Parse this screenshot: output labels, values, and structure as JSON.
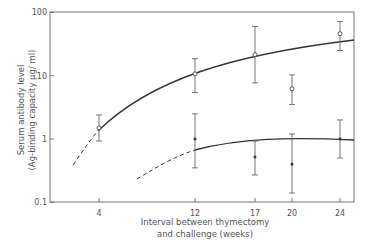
{
  "chart_data": {
    "type": "scatter",
    "title": "",
    "xlabel": "Interval between thymectomy and challenge (weeks)",
    "xlabel_lines": [
      "Interval between thymectomy",
      "and challenge (weeks)"
    ],
    "ylabel": "Serum antibody level (Ag-binding capacity µg/ml)",
    "ylabel_lines": [
      "Serum antibody level",
      "(Ag-binding capacity μg/ ml)"
    ],
    "yscale": "log",
    "ylim": [
      0.1,
      100
    ],
    "x_ticks": [
      4,
      12,
      17,
      20,
      24
    ],
    "y_ticks": [
      0.1,
      1,
      10,
      100
    ],
    "y_tick_labels": [
      "0.1",
      "1",
      "10",
      "100"
    ],
    "grid": false,
    "legend": "none",
    "series": [
      {
        "name": "open circles (upper)",
        "marker": "open-circle",
        "x": [
          4,
          12,
          17,
          20,
          24
        ],
        "values": [
          1.5,
          10.7,
          21.5,
          6.2,
          46
        ],
        "err_high": [
          2.4,
          18.6,
          60,
          10.3,
          72
        ],
        "err_low": [
          0.93,
          5.4,
          7.7,
          3.5,
          25
        ],
        "fit_curve": "solid, dashed extension below x=4"
      },
      {
        "name": "filled squares (lower)",
        "marker": "filled-square",
        "x": [
          12,
          17,
          20,
          24
        ],
        "values": [
          1.0,
          0.52,
          0.4,
          1.0
        ],
        "err_high": [
          2.5,
          0.93,
          1.2,
          2.0
        ],
        "err_low": [
          0.35,
          0.27,
          0.14,
          0.5
        ],
        "fit_curve": "solid plateau ~1.0, dashed extension below x=12"
      }
    ]
  }
}
